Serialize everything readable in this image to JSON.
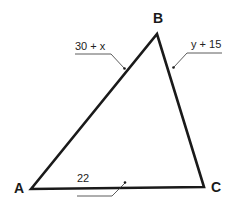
{
  "diagram": {
    "type": "triangle",
    "vertices": [
      {
        "id": "A",
        "label": "A",
        "x": 31,
        "y": 189,
        "label_x": 14,
        "label_y": 193
      },
      {
        "id": "B",
        "label": "B",
        "x": 157,
        "y": 34,
        "label_x": 153,
        "label_y": 23
      },
      {
        "id": "C",
        "label": "C",
        "x": 204,
        "y": 187,
        "label_x": 211,
        "label_y": 192
      }
    ],
    "sides": [
      {
        "id": "AB",
        "label": "30 + x"
      },
      {
        "id": "BC",
        "label": "y + 15"
      },
      {
        "id": "AC",
        "label": "22"
      }
    ],
    "colors": {
      "stroke": "#1a1a1a",
      "leader": "#333333",
      "background": "#ffffff"
    }
  }
}
